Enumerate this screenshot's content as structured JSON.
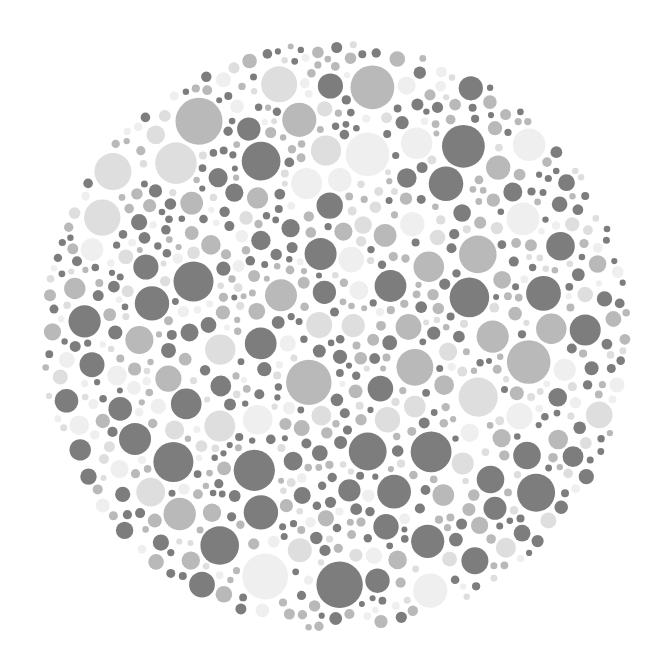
{
  "plate": {
    "type": "dot-plate",
    "background": "#ffffff",
    "center": [
      335,
      336
    ],
    "radius": 296,
    "tones": [
      {
        "name": "dark",
        "color": "#7d7d7d",
        "weight": 0.4
      },
      {
        "name": "mid",
        "color": "#b9b9b9",
        "weight": 0.3
      },
      {
        "name": "light",
        "color": "#dedede",
        "weight": 0.18
      },
      {
        "name": "faint",
        "color": "#efefef",
        "weight": 0.12
      }
    ],
    "dot_radius_range": [
      3,
      24
    ],
    "seed": 7331,
    "attempts": 26000
  }
}
